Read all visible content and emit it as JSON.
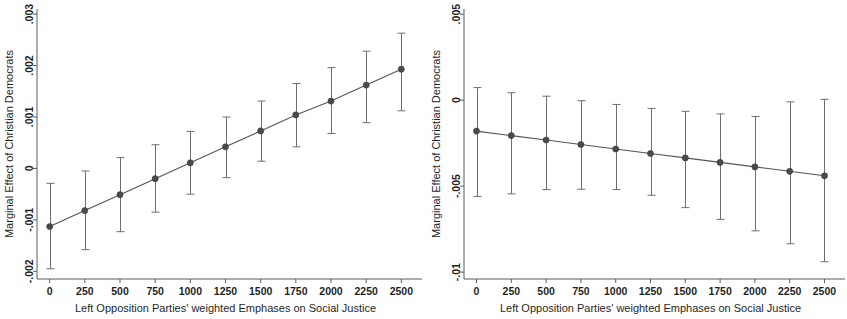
{
  "figure": {
    "background": "#ffffff",
    "line_color": "#555555",
    "marker_color": "#4a4a4a",
    "errorbar_color": "#6e6e6e",
    "axis_color": "#5b5b5b",
    "panel_count": 2
  },
  "chart_data": [
    {
      "type": "line",
      "panel": "left",
      "title": "",
      "xlabel": "Left Opposition Parties' weighted Emphases on Social Justice",
      "ylabel": "Marginal Effect of Christian Democrats",
      "x": [
        0,
        250,
        500,
        750,
        1000,
        1250,
        1500,
        1750,
        2000,
        2250,
        2500
      ],
      "xticklabels": [
        "0",
        "250",
        "500",
        "750",
        "1000",
        "1250",
        "1500",
        "1750",
        "2000",
        "2250",
        "2500"
      ],
      "yticks": [
        -0.002,
        -0.001,
        0,
        0.001,
        0.002,
        0.003
      ],
      "yticklabels": [
        "-.002",
        "-.001",
        "0",
        ".001",
        ".002",
        ".003"
      ],
      "xlim": [
        -90,
        2590
      ],
      "ylim": [
        -0.00215,
        0.0031
      ],
      "grid": false,
      "legend": null,
      "series": [
        {
          "name": "Marginal effect",
          "values": [
            -0.00113,
            -0.00082,
            -0.00051,
            -0.0002,
            0.00011,
            0.00042,
            0.00073,
            0.00104,
            0.00131,
            0.00162,
            0.00193
          ]
        }
      ],
      "error_bars": {
        "kind": "95% confidence interval",
        "lower": [
          -0.00195,
          -0.00158,
          -0.00123,
          -0.00085,
          -0.0005,
          -0.00018,
          0.00014,
          0.00042,
          0.00068,
          0.00089,
          0.00112
        ],
        "upper": [
          -0.00029,
          -5e-05,
          0.00021,
          0.00046,
          0.00072,
          0.001,
          0.00131,
          0.00165,
          0.00196,
          0.00228,
          0.00263
        ]
      }
    },
    {
      "type": "line",
      "panel": "right",
      "title": "",
      "xlabel": "Left Opposition Parties' weighted Emphases on Social Justice",
      "ylabel": "Marginal Effect of Christian Democrats",
      "x": [
        0,
        250,
        500,
        750,
        1000,
        1250,
        1500,
        1750,
        2000,
        2250,
        2500
      ],
      "xticklabels": [
        "0",
        "250",
        "500",
        "750",
        "1000",
        "1250",
        "1500",
        "1750",
        "2000",
        "2250",
        "2500"
      ],
      "yticks": [
        -0.01,
        -0.005,
        0,
        0.005
      ],
      "yticklabels": [
        "-.01",
        "-.005",
        "0",
        ".005"
      ],
      "xlim": [
        -90,
        2590
      ],
      "ylim": [
        -0.0104,
        0.0053
      ],
      "grid": false,
      "legend": null,
      "series": [
        {
          "name": "Marginal effect",
          "values": [
            -0.0018,
            -0.00206,
            -0.00232,
            -0.00258,
            -0.00284,
            -0.0031,
            -0.00336,
            -0.00362,
            -0.00388,
            -0.00414,
            -0.0044
          ]
        }
      ],
      "error_bars": {
        "kind": "95% confidence interval",
        "lower": [
          -0.0056,
          -0.00545,
          -0.0052,
          -0.00518,
          -0.0052,
          -0.00553,
          -0.00625,
          -0.00693,
          -0.0076,
          -0.00835,
          -0.0094
        ],
        "upper": [
          0.00073,
          0.00043,
          0.00023,
          -3e-05,
          -0.00025,
          -0.00048,
          -0.00065,
          -0.0008,
          -0.00095,
          -0.0001,
          5e-05
        ]
      }
    }
  ]
}
